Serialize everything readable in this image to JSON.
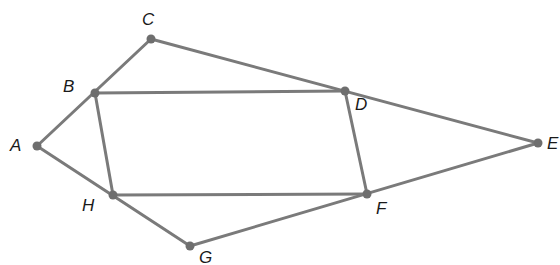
{
  "diagram": {
    "type": "geometry-figure",
    "stroke_color": "#7a7a7a",
    "point_color": "#6e6e6e",
    "label_color": "#1a1a1a",
    "points": [
      {
        "name": "A",
        "x": 37,
        "y": 146,
        "label_x": 10,
        "label_y": 137
      },
      {
        "name": "B",
        "x": 95,
        "y": 93,
        "label_x": 63,
        "label_y": 78
      },
      {
        "name": "C",
        "x": 151,
        "y": 39,
        "label_x": 142,
        "label_y": 11
      },
      {
        "name": "D",
        "x": 345,
        "y": 91,
        "label_x": 355,
        "label_y": 96
      },
      {
        "name": "E",
        "x": 538,
        "y": 143,
        "label_x": 547,
        "label_y": 135
      },
      {
        "name": "F",
        "x": 367,
        "y": 194,
        "label_x": 376,
        "label_y": 200
      },
      {
        "name": "G",
        "x": 190,
        "y": 246,
        "label_x": 199,
        "label_y": 249
      },
      {
        "name": "H",
        "x": 113,
        "y": 195,
        "label_x": 82,
        "label_y": 197
      }
    ],
    "segments": [
      [
        "A",
        "C"
      ],
      [
        "C",
        "E"
      ],
      [
        "A",
        "G"
      ],
      [
        "G",
        "E"
      ],
      [
        "B",
        "D"
      ],
      [
        "D",
        "F"
      ],
      [
        "F",
        "H"
      ],
      [
        "H",
        "B"
      ]
    ]
  }
}
